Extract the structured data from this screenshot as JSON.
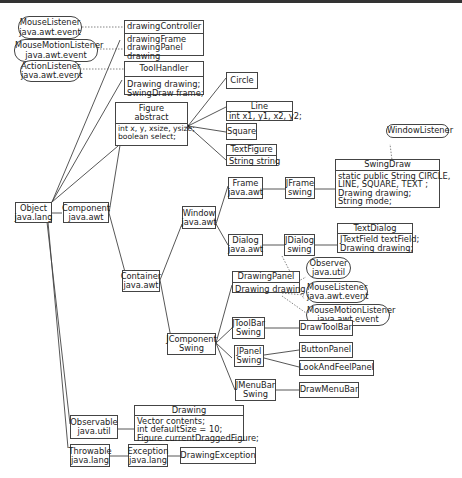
{
  "interfaces": {
    "mouse_listener_top": {
      "name": "MouseListener",
      "pkg": "java.awt.event"
    },
    "mouse_motion_listener_top": {
      "name": "MouseMotionListener",
      "pkg": "java.awt.event"
    },
    "action_listener": {
      "name": "ActionListener",
      "pkg": "java.awt.event"
    },
    "window_listener": {
      "name": "WindowListener"
    },
    "observer": {
      "name": "Observer",
      "pkg": "java.util"
    },
    "mouse_listener_panel": {
      "name": "MouseListener",
      "pkg": "java.awt.event"
    },
    "mouse_motion_listener_panel": {
      "name": "MouseMotionListener",
      "pkg": "java.awt.event"
    }
  },
  "classes": {
    "drawing_controller": {
      "name": "drawingController",
      "fields": [
        "drawingFrame",
        "drawingPanel",
        "drawing"
      ]
    },
    "tool_handler": {
      "name": "ToolHandler",
      "fields": [
        "Drawing drawing;",
        "SwingDraw frame;"
      ]
    },
    "figure": {
      "name": "Figure",
      "sub": "abstract",
      "fields": [
        "int x, y, xsize, ysize;",
        "boolean select;"
      ]
    },
    "circle": {
      "name": "Circle"
    },
    "line": {
      "name": "Line",
      "fields": [
        "int x1, y1, x2, y2;"
      ]
    },
    "square": {
      "name": "Square"
    },
    "text_figure": {
      "name": "TextFigure",
      "fields": [
        "String string"
      ]
    },
    "object": {
      "name": "Object",
      "pkg": "java.lang"
    },
    "component": {
      "name": "Component",
      "pkg": "java.awt"
    },
    "container": {
      "name": "Container",
      "pkg": "java.awt"
    },
    "window": {
      "name": "Window",
      "pkg": "java.awt"
    },
    "frame": {
      "name": "Frame",
      "pkg": "java.awt"
    },
    "jframe": {
      "name": "JFrame",
      "pkg": "swing"
    },
    "swing_draw": {
      "name": "SwingDraw",
      "fields": [
        "static public String CIRCLE,",
        "LINE,  SQUARE,   TEXT ;",
        "Drawing drawing;",
        "String mode;"
      ]
    },
    "dialog": {
      "name": "Dialog",
      "pkg": "java.awt"
    },
    "jdialog": {
      "name": "JDialog",
      "pkg": "swing"
    },
    "text_dialog": {
      "name": "TextDialog",
      "fields": [
        "JTextField textField;",
        "Drawing drawing;"
      ]
    },
    "jcomponent": {
      "name": "JComponent",
      "pkg": "Swing"
    },
    "drawing_panel": {
      "name": "DrawingPanel",
      "fields": [
        "Drawing drawing"
      ]
    },
    "jtoolbar": {
      "name": "JToolBar",
      "pkg": "Swing"
    },
    "draw_toolbar": {
      "name": "DrawToolBar"
    },
    "jpanel": {
      "name": "JPanel",
      "pkg": "Swing"
    },
    "button_panel": {
      "name": "ButtonPanel"
    },
    "look_and_feel_panel": {
      "name": "LookAndFeelPanel"
    },
    "jmenubar": {
      "name": "JMenuBar",
      "pkg": "Swing"
    },
    "draw_menubar": {
      "name": "DrawMenuBar"
    },
    "observable": {
      "name": "Observable",
      "pkg": "java.util"
    },
    "drawing": {
      "name": "Drawing",
      "fields": [
        "Vector contents;",
        "int defaultSize  = 10;",
        "Figure currentDraggedFigure;"
      ]
    },
    "throwable": {
      "name": "Throwable",
      "pkg": "java.lang"
    },
    "exception": {
      "name": "Exception",
      "pkg": "java.lang"
    },
    "drawing_exception": {
      "name": "DrawingException"
    }
  }
}
